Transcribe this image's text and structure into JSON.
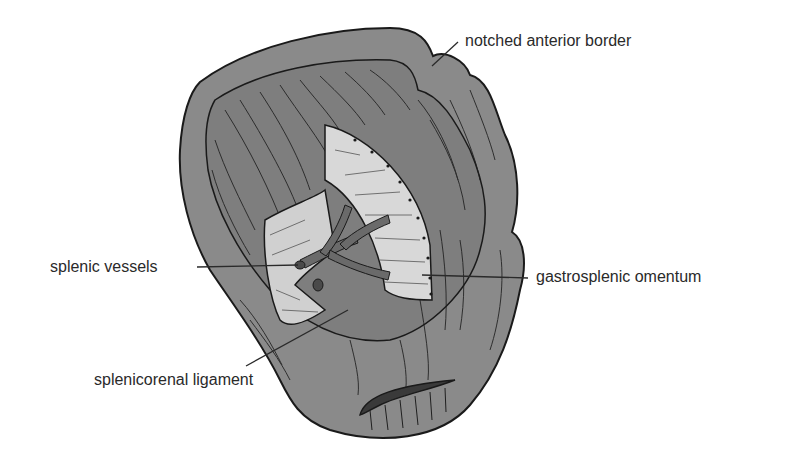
{
  "figure": {
    "labels": {
      "notched_border": "notched anterior border",
      "splenic_vessels": "splenic vessels",
      "gastrosplenic": "gastrosplenic omentum",
      "splenicorenal": "splenicorenal ligament"
    },
    "colors": {
      "organ_fill": "#8a8a8a",
      "organ_rim": "#9a9a9a",
      "outline": "#1a1a1a",
      "ligament_fill": "#d8d8d8",
      "vessel_fill": "#6a6a6a",
      "leader_line": "#2a2a2a",
      "text": "#2a2a2a"
    }
  }
}
